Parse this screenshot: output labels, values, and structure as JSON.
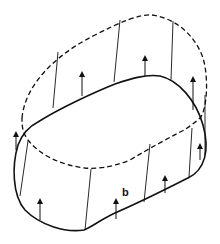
{
  "diagram": {
    "type": "dislocation-loop-slip-diagram",
    "colors": {
      "stroke": "#111111",
      "background": "#ffffff"
    },
    "solid_loop": {
      "style": "solid",
      "path": "M 38 122 C 60 108, 95 92, 115 84 C 130 79, 145 74, 160 76 C 178 80, 196 100, 203 125 C 210 150, 205 170, 188 178 C 170 187, 145 200, 115 213 C 100 220, 90 228, 84 230 C 65 233, 40 225, 25 210 C 12 195, 12 165, 18 145 C 23 132, 30 126, 38 122 Z"
    },
    "dashed_loop": {
      "style": "dashed",
      "path": "M 22 118 C 25 85, 55 55, 95 35 C 120 22, 140 14, 152 15 C 175 18, 195 35, 203 58 C 209 78, 207 110, 200 118 C 192 125, 185 130, 180 132 C 165 140, 150 148, 130 160 C 110 168, 95 169, 85 168 C 60 165, 40 155, 28 140 C 22 132, 22 125, 22 118 Z"
    },
    "connectors": [
      {
        "x1": 58,
        "y1": 52,
        "x2": 53,
        "y2": 108
      },
      {
        "x1": 120,
        "y1": 20,
        "x2": 114,
        "y2": 82
      },
      {
        "x1": 173,
        "y1": 21,
        "x2": 171,
        "y2": 80
      },
      {
        "x1": 205,
        "y1": 95,
        "x2": 205,
        "y2": 155
      },
      {
        "x1": 28,
        "y1": 141,
        "x2": 20,
        "y2": 196
      },
      {
        "x1": 91,
        "y1": 169,
        "x2": 85,
        "y2": 230
      },
      {
        "x1": 150,
        "y1": 144,
        "x2": 144,
        "y2": 202
      },
      {
        "x1": 192,
        "y1": 128,
        "x2": 189,
        "y2": 177
      }
    ],
    "arrows": [
      {
        "x": 82,
        "y1": 96,
        "y2": 74
      },
      {
        "x": 145,
        "y1": 76,
        "y2": 58
      },
      {
        "x": 193,
        "y1": 110,
        "y2": 79
      },
      {
        "x": 16,
        "y1": 150,
        "y2": 134
      },
      {
        "x": 40,
        "y1": 220,
        "y2": 201
      },
      {
        "x": 116,
        "y1": 219,
        "y2": 201
      },
      {
        "x": 165,
        "y1": 193,
        "y2": 178
      },
      {
        "x": 200,
        "y1": 160,
        "y2": 146
      }
    ],
    "labels": [
      {
        "text": "b",
        "x": 122,
        "y": 198
      }
    ]
  }
}
